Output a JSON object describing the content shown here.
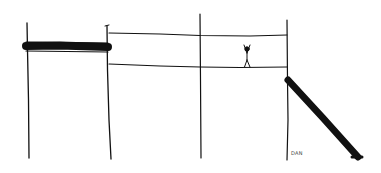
{
  "drawing": {
    "style": "hand-drawn black ink sketch on white",
    "background": "#ffffff",
    "ink": "#111111",
    "signature": "DAN",
    "elements": [
      "four vertical poles",
      "thick horizontal bar between first two poles",
      "two thin horizontal lines between second and fourth poles forming a band",
      "stick figure with raised arms standing on lower line",
      "thick diagonal slide descending right from fourth pole"
    ]
  }
}
